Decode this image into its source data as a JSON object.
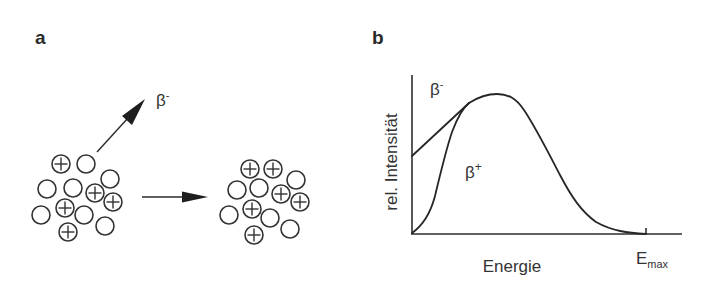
{
  "panels": {
    "a": {
      "label": "a",
      "emitted_particle": {
        "symbol": "β",
        "superscript": "-"
      },
      "nucleus_before": {
        "radius": 9,
        "particles": [
          {
            "x": 61,
            "y": 164,
            "type": "proton"
          },
          {
            "x": 86,
            "y": 164,
            "type": "neutron"
          },
          {
            "x": 110,
            "y": 179,
            "type": "neutron"
          },
          {
            "x": 47,
            "y": 189,
            "type": "neutron"
          },
          {
            "x": 73,
            "y": 188,
            "type": "neutron"
          },
          {
            "x": 95,
            "y": 193,
            "type": "proton"
          },
          {
            "x": 113,
            "y": 202,
            "type": "proton"
          },
          {
            "x": 41,
            "y": 215,
            "type": "neutron"
          },
          {
            "x": 65,
            "y": 208,
            "type": "proton"
          },
          {
            "x": 84,
            "y": 215,
            "type": "neutron"
          },
          {
            "x": 105,
            "y": 226,
            "type": "neutron"
          },
          {
            "x": 68,
            "y": 232,
            "type": "proton"
          }
        ]
      },
      "nucleus_after": {
        "radius": 9,
        "particles": [
          {
            "x": 250,
            "y": 169,
            "type": "proton"
          },
          {
            "x": 273,
            "y": 169,
            "type": "proton"
          },
          {
            "x": 296,
            "y": 180,
            "type": "neutron"
          },
          {
            "x": 237,
            "y": 190,
            "type": "neutron"
          },
          {
            "x": 259,
            "y": 188,
            "type": "neutron"
          },
          {
            "x": 281,
            "y": 194,
            "type": "proton"
          },
          {
            "x": 300,
            "y": 202,
            "type": "proton"
          },
          {
            "x": 229,
            "y": 215,
            "type": "neutron"
          },
          {
            "x": 252,
            "y": 209,
            "type": "proton"
          },
          {
            "x": 270,
            "y": 218,
            "type": "neutron"
          },
          {
            "x": 290,
            "y": 229,
            "type": "neutron"
          },
          {
            "x": 254,
            "y": 235,
            "type": "proton"
          }
        ]
      },
      "arrows": [
        {
          "name": "emission-arrow",
          "x1": 97,
          "y1": 152,
          "x2": 145,
          "y2": 99
        },
        {
          "name": "transition-arrow",
          "x1": 142,
          "y1": 197,
          "x2": 208,
          "y2": 197
        }
      ]
    },
    "b": {
      "label": "b",
      "ylabel": "rel. Intensität",
      "xlabel": "Energie",
      "emax_label": {
        "main": "E",
        "subscript": "max"
      },
      "curve_labels": {
        "beta_minus": {
          "symbol": "β",
          "superscript": "-"
        },
        "beta_plus": {
          "symbol": "β",
          "superscript": "+"
        }
      }
    }
  },
  "chart_data": {
    "type": "line",
    "title": "",
    "xlabel": "Energie",
    "ylabel": "rel. Intensität",
    "x_ticks": [
      "E_max"
    ],
    "grid": false,
    "legend": "inline labels",
    "xlim": [
      0,
      1
    ],
    "ylim": [
      0,
      1
    ],
    "series": [
      {
        "name": "β-",
        "x": [
          0.0,
          0.1,
          0.2,
          0.25,
          0.35,
          0.45,
          0.55,
          0.65,
          0.75,
          0.85,
          0.95,
          1.0
        ],
        "y": [
          0.55,
          0.74,
          0.92,
          0.97,
          1.0,
          0.87,
          0.64,
          0.38,
          0.17,
          0.05,
          0.01,
          0.0
        ]
      },
      {
        "name": "β+",
        "x": [
          0.0,
          0.05,
          0.1,
          0.15,
          0.2,
          0.25,
          0.35,
          0.45,
          0.55,
          0.65,
          0.75,
          0.85,
          0.95,
          1.0
        ],
        "y": [
          0.0,
          0.12,
          0.3,
          0.55,
          0.8,
          0.97,
          1.0,
          0.87,
          0.64,
          0.38,
          0.17,
          0.05,
          0.01,
          0.0
        ]
      }
    ]
  }
}
